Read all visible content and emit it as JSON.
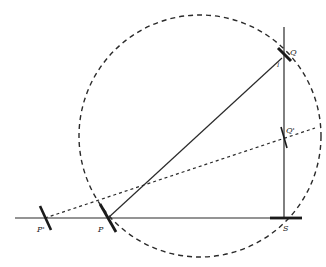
{
  "diagram": {
    "type": "geometric-construction",
    "colors": {
      "ink": "#2a2a2a",
      "background": "#ffffff"
    },
    "circle": {
      "cx": 200,
      "cy": 136,
      "r": 121,
      "style": "dashed"
    },
    "baseline": {
      "x1": 15,
      "y1": 218,
      "x2": 302,
      "y2": 218
    },
    "vertical": {
      "x1": 284,
      "y1": 27,
      "x2": 284,
      "y2": 218
    },
    "points": {
      "P_prime": {
        "label": "P'",
        "x": 45,
        "y": 218
      },
      "P": {
        "label": "P",
        "x": 108,
        "y": 218
      },
      "S": {
        "label": "S",
        "x": 285,
        "y": 218
      },
      "Q": {
        "label": "Q",
        "x": 284,
        "y": 57
      },
      "Q_prime": {
        "label": "Q'",
        "x": 284,
        "y": 137
      },
      "I": {
        "label": "I",
        "x": 280,
        "y": 62
      }
    },
    "segments": [
      {
        "name": "PQ",
        "from": "P",
        "to": "Q",
        "style": "solid"
      },
      {
        "name": "P'Q'",
        "from": "P_prime",
        "to": "Q_prime",
        "style": "dashed",
        "extends_to": {
          "x": 315,
          "y": 128
        }
      }
    ],
    "labels": {
      "p_prime": "P'",
      "p": "P",
      "s": "S",
      "q": "Q",
      "q_prime": "Q'",
      "i": "I"
    }
  }
}
